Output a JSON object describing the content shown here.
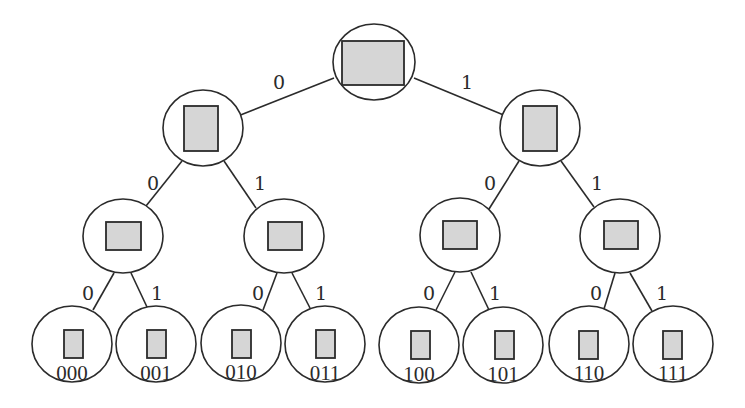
{
  "diagram": {
    "type": "binary-tree",
    "colors": {
      "stroke": "#2b2b2b",
      "box_fill": "#d6d6d6",
      "node_fill": "#ffffff"
    },
    "nodes": [
      {
        "id": "root",
        "cx": 374,
        "cy": 62,
        "rx": 41,
        "ry": 38,
        "box": [
          342,
          41,
          62,
          44
        ],
        "label": ""
      },
      {
        "id": "n0",
        "cx": 203,
        "cy": 128,
        "rx": 40,
        "ry": 38,
        "box": [
          184,
          106,
          34,
          45
        ],
        "label": ""
      },
      {
        "id": "n1",
        "cx": 540,
        "cy": 128,
        "rx": 40,
        "ry": 38,
        "box": [
          523,
          106,
          34,
          45
        ],
        "label": ""
      },
      {
        "id": "n00",
        "cx": 123,
        "cy": 236,
        "rx": 40,
        "ry": 37,
        "box": [
          106,
          222,
          35,
          28
        ],
        "label": ""
      },
      {
        "id": "n01",
        "cx": 284,
        "cy": 236,
        "rx": 40,
        "ry": 37,
        "box": [
          268,
          222,
          34,
          28
        ],
        "label": ""
      },
      {
        "id": "n10",
        "cx": 460,
        "cy": 235,
        "rx": 40,
        "ry": 37,
        "box": [
          443,
          221,
          34,
          28
        ],
        "label": ""
      },
      {
        "id": "n11",
        "cx": 620,
        "cy": 236,
        "rx": 40,
        "ry": 37,
        "box": [
          604,
          221,
          34,
          28
        ],
        "label": ""
      },
      {
        "id": "l000",
        "cx": 72,
        "cy": 344,
        "rx": 40,
        "ry": 38,
        "box": [
          64,
          330,
          19,
          28
        ],
        "label": "000"
      },
      {
        "id": "l001",
        "cx": 156,
        "cy": 344,
        "rx": 40,
        "ry": 38,
        "box": [
          147,
          330,
          19,
          28
        ],
        "label": "001"
      },
      {
        "id": "l010",
        "cx": 241,
        "cy": 343,
        "rx": 40,
        "ry": 38,
        "box": [
          232,
          330,
          19,
          28
        ],
        "label": "010"
      },
      {
        "id": "l011",
        "cx": 325,
        "cy": 344,
        "rx": 40,
        "ry": 38,
        "box": [
          316,
          330,
          19,
          28
        ],
        "label": "011"
      },
      {
        "id": "l100",
        "cx": 419,
        "cy": 345,
        "rx": 40,
        "ry": 38,
        "box": [
          411,
          331,
          19,
          28
        ],
        "label": "100"
      },
      {
        "id": "l101",
        "cx": 503,
        "cy": 345,
        "rx": 40,
        "ry": 38,
        "box": [
          495,
          331,
          19,
          28
        ],
        "label": "101"
      },
      {
        "id": "l110",
        "cx": 589,
        "cy": 344,
        "rx": 40,
        "ry": 38,
        "box": [
          579,
          331,
          19,
          28
        ],
        "label": "110"
      },
      {
        "id": "l111",
        "cx": 673,
        "cy": 344,
        "rx": 40,
        "ry": 38,
        "box": [
          663,
          331,
          19,
          28
        ],
        "label": "111"
      }
    ],
    "edges": [
      {
        "from": "root",
        "to": "n0",
        "label": "0",
        "x1": 334,
        "y1": 78,
        "x2": 238,
        "y2": 116,
        "lx": 279,
        "ly": 83
      },
      {
        "from": "root",
        "to": "n1",
        "label": "1",
        "x1": 414,
        "y1": 78,
        "x2": 506,
        "y2": 116,
        "lx": 467,
        "ly": 83
      },
      {
        "from": "n0",
        "to": "n00",
        "label": "0",
        "x1": 182,
        "y1": 161,
        "x2": 146,
        "y2": 206,
        "lx": 153,
        "ly": 184
      },
      {
        "from": "n0",
        "to": "n01",
        "label": "1",
        "x1": 224,
        "y1": 161,
        "x2": 256,
        "y2": 208,
        "lx": 260,
        "ly": 184
      },
      {
        "from": "n1",
        "to": "n10",
        "label": "0",
        "x1": 519,
        "y1": 161,
        "x2": 489,
        "y2": 209,
        "lx": 490,
        "ly": 184
      },
      {
        "from": "n1",
        "to": "n11",
        "label": "1",
        "x1": 561,
        "y1": 161,
        "x2": 594,
        "y2": 207,
        "lx": 597,
        "ly": 184
      },
      {
        "from": "n00",
        "to": "l000",
        "label": "0",
        "x1": 114,
        "y1": 273,
        "x2": 93,
        "y2": 310,
        "lx": 88,
        "ly": 294
      },
      {
        "from": "n00",
        "to": "l001",
        "label": "1",
        "x1": 131,
        "y1": 273,
        "x2": 147,
        "y2": 307,
        "lx": 157,
        "ly": 294
      },
      {
        "from": "n01",
        "to": "l010",
        "label": "0",
        "x1": 277,
        "y1": 273,
        "x2": 263,
        "y2": 310,
        "lx": 258,
        "ly": 294
      },
      {
        "from": "n01",
        "to": "l011",
        "label": "1",
        "x1": 292,
        "y1": 273,
        "x2": 310,
        "y2": 308,
        "lx": 321,
        "ly": 294
      },
      {
        "from": "n10",
        "to": "l100",
        "label": "0",
        "x1": 455,
        "y1": 272,
        "x2": 436,
        "y2": 310,
        "lx": 429,
        "ly": 294
      },
      {
        "from": "n10",
        "to": "l101",
        "label": "1",
        "x1": 471,
        "y1": 272,
        "x2": 489,
        "y2": 310,
        "lx": 495,
        "ly": 294
      },
      {
        "from": "n11",
        "to": "l110",
        "label": "0",
        "x1": 615,
        "y1": 273,
        "x2": 604,
        "y2": 309,
        "lx": 596,
        "ly": 294
      },
      {
        "from": "n11",
        "to": "l111",
        "label": "1",
        "x1": 630,
        "y1": 273,
        "x2": 652,
        "y2": 311,
        "lx": 662,
        "ly": 294
      }
    ]
  }
}
